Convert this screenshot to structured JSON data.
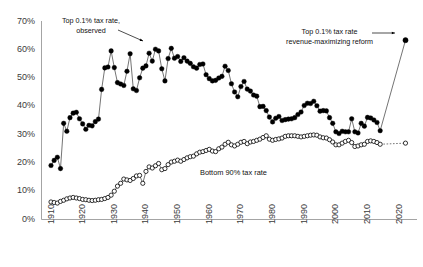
{
  "chart_data": {
    "type": "scatter",
    "title": "",
    "xlabel": "",
    "ylabel": "",
    "xlim": [
      1910,
      2026
    ],
    "ylim": [
      0,
      0.7
    ],
    "grid": false,
    "legend_position": "inline-annotations",
    "ytick_labels": [
      "0%",
      "10%",
      "20%",
      "30%",
      "40%",
      "50%",
      "60%",
      "70%"
    ],
    "ytick_values": [
      0,
      10,
      20,
      30,
      40,
      50,
      60,
      70
    ],
    "xtick_labels": [
      "1910",
      "1920",
      "1930",
      "1940",
      "1950",
      "1960",
      "1970",
      "1980",
      "1990",
      "2000",
      "2010",
      "2020"
    ],
    "xtick_values": [
      1910,
      1920,
      1930,
      1940,
      1950,
      1960,
      1970,
      1980,
      1990,
      2000,
      2010,
      2020
    ],
    "annotations": [
      {
        "name": "top-series-annotation",
        "text": "Top 0.1% tax rate,\nobserved",
        "x_px": 62,
        "y_px": 16,
        "arrow": "to-lower-right"
      },
      {
        "name": "reform-annotation",
        "text": "Top 0.1% tax rate\nrevenue-maximizing reform",
        "x_px": 286,
        "y_px": 27,
        "arrow": "to-right"
      },
      {
        "name": "bottom-series-annotation",
        "text": "Bottom 90% tax rate",
        "x_px": 200,
        "y_px": 168,
        "arrow": "none"
      }
    ],
    "series": [
      {
        "name": "Top 0.1% tax rate, observed",
        "marker": "filled-circle",
        "color": "#000000",
        "points": [
          [
            1913,
            19.1
          ],
          [
            1914,
            20.9
          ],
          [
            1915,
            22.0
          ],
          [
            1916,
            18.0
          ],
          [
            1917,
            34.0
          ],
          [
            1918,
            31.2
          ],
          [
            1919,
            36.0
          ],
          [
            1920,
            37.6
          ],
          [
            1921,
            37.9
          ],
          [
            1922,
            35.6
          ],
          [
            1923,
            33.8
          ],
          [
            1924,
            31.9
          ],
          [
            1925,
            33.3
          ],
          [
            1926,
            33.1
          ],
          [
            1927,
            34.6
          ],
          [
            1928,
            35.5
          ],
          [
            1929,
            46.0
          ],
          [
            1930,
            53.6
          ],
          [
            1931,
            53.9
          ],
          [
            1932,
            59.6
          ],
          [
            1933,
            53.7
          ],
          [
            1934,
            48.4
          ],
          [
            1935,
            47.9
          ],
          [
            1936,
            47.4
          ],
          [
            1937,
            52.4
          ],
          [
            1938,
            58.6
          ],
          [
            1939,
            46.2
          ],
          [
            1940,
            45.6
          ],
          [
            1941,
            50.1
          ],
          [
            1942,
            53.5
          ],
          [
            1943,
            54.3
          ],
          [
            1944,
            58.8
          ],
          [
            1945,
            56.0
          ],
          [
            1946,
            60.2
          ],
          [
            1947,
            59.6
          ],
          [
            1948,
            53.3
          ],
          [
            1949,
            49.0
          ],
          [
            1950,
            56.9
          ],
          [
            1951,
            60.5
          ],
          [
            1952,
            57.0
          ],
          [
            1953,
            57.6
          ],
          [
            1954,
            55.9
          ],
          [
            1955,
            57.2
          ],
          [
            1956,
            56.0
          ],
          [
            1957,
            55.2
          ],
          [
            1958,
            54.0
          ],
          [
            1959,
            53.5
          ],
          [
            1960,
            54.8
          ],
          [
            1961,
            55.0
          ],
          [
            1962,
            51.2
          ],
          [
            1963,
            49.8
          ],
          [
            1964,
            49.0
          ],
          [
            1965,
            49.2
          ],
          [
            1966,
            50.0
          ],
          [
            1967,
            50.6
          ],
          [
            1968,
            54.2
          ],
          [
            1969,
            52.7
          ],
          [
            1970,
            48.0
          ],
          [
            1971,
            45.1
          ],
          [
            1972,
            43.4
          ],
          [
            1973,
            47.0
          ],
          [
            1974,
            48.8
          ],
          [
            1975,
            46.1
          ],
          [
            1976,
            45.4
          ],
          [
            1977,
            44.0
          ],
          [
            1978,
            43.6
          ],
          [
            1979,
            39.9
          ],
          [
            1980,
            40.0
          ],
          [
            1981,
            38.5
          ],
          [
            1982,
            36.2
          ],
          [
            1983,
            34.5
          ],
          [
            1984,
            35.8
          ],
          [
            1985,
            36.4
          ],
          [
            1986,
            35.0
          ],
          [
            1987,
            35.3
          ],
          [
            1988,
            35.5
          ],
          [
            1989,
            35.6
          ],
          [
            1990,
            36.0
          ],
          [
            1991,
            37.1
          ],
          [
            1992,
            38.0
          ],
          [
            1993,
            40.3
          ],
          [
            1994,
            41.1
          ],
          [
            1995,
            41.0
          ],
          [
            1996,
            41.8
          ],
          [
            1997,
            40.2
          ],
          [
            1998,
            38.3
          ],
          [
            1999,
            38.5
          ],
          [
            2000,
            38.4
          ],
          [
            2001,
            36.0
          ],
          [
            2002,
            34.0
          ],
          [
            2003,
            31.0
          ],
          [
            2004,
            30.4
          ],
          [
            2005,
            31.2
          ],
          [
            2006,
            31.0
          ],
          [
            2007,
            31.0
          ],
          [
            2008,
            35.6
          ],
          [
            2009,
            31.0
          ],
          [
            2010,
            30.6
          ],
          [
            2011,
            34.0
          ],
          [
            2012,
            33.0
          ],
          [
            2013,
            36.1
          ],
          [
            2014,
            35.9
          ],
          [
            2015,
            35.2
          ],
          [
            2016,
            34.3
          ],
          [
            2017,
            31.4
          ]
        ]
      },
      {
        "name": "Top 0.1% tax rate, revenue-maximizing reform",
        "marker": "filled-circle",
        "color": "#000000",
        "line_style": "thin-connector",
        "points": [
          [
            2025,
            63.4
          ]
        ]
      },
      {
        "name": "Bottom 90% tax rate",
        "marker": "open-circle",
        "color": "#000000",
        "points": [
          [
            1913,
            6.2
          ],
          [
            1914,
            6.0
          ],
          [
            1915,
            5.8
          ],
          [
            1916,
            6.4
          ],
          [
            1917,
            6.8
          ],
          [
            1918,
            7.3
          ],
          [
            1919,
            7.6
          ],
          [
            1920,
            7.8
          ],
          [
            1921,
            7.6
          ],
          [
            1922,
            7.4
          ],
          [
            1923,
            7.1
          ],
          [
            1924,
            7.0
          ],
          [
            1925,
            6.8
          ],
          [
            1926,
            6.7
          ],
          [
            1927,
            6.8
          ],
          [
            1928,
            7.0
          ],
          [
            1929,
            7.1
          ],
          [
            1930,
            7.4
          ],
          [
            1931,
            7.8
          ],
          [
            1932,
            8.6
          ],
          [
            1933,
            10.0
          ],
          [
            1934,
            11.8
          ],
          [
            1935,
            12.8
          ],
          [
            1936,
            14.3
          ],
          [
            1937,
            14.0
          ],
          [
            1938,
            13.8
          ],
          [
            1939,
            14.5
          ],
          [
            1940,
            15.4
          ],
          [
            1941,
            15.6
          ],
          [
            1942,
            12.8
          ],
          [
            1943,
            17.0
          ],
          [
            1944,
            18.6
          ],
          [
            1945,
            18.2
          ],
          [
            1946,
            19.0
          ],
          [
            1947,
            19.8
          ],
          [
            1948,
            17.6
          ],
          [
            1949,
            18.0
          ],
          [
            1950,
            19.4
          ],
          [
            1951,
            20.3
          ],
          [
            1952,
            20.6
          ],
          [
            1953,
            21.0
          ],
          [
            1954,
            20.6
          ],
          [
            1955,
            21.2
          ],
          [
            1956,
            21.8
          ],
          [
            1957,
            22.2
          ],
          [
            1958,
            22.4
          ],
          [
            1959,
            23.2
          ],
          [
            1960,
            23.8
          ],
          [
            1961,
            24.0
          ],
          [
            1962,
            24.4
          ],
          [
            1963,
            24.8
          ],
          [
            1964,
            24.2
          ],
          [
            1965,
            24.0
          ],
          [
            1966,
            25.0
          ],
          [
            1967,
            25.6
          ],
          [
            1968,
            26.6
          ],
          [
            1969,
            27.3
          ],
          [
            1970,
            26.4
          ],
          [
            1971,
            26.0
          ],
          [
            1972,
            26.6
          ],
          [
            1973,
            27.3
          ],
          [
            1974,
            27.6
          ],
          [
            1975,
            26.8
          ],
          [
            1976,
            27.4
          ],
          [
            1977,
            27.6
          ],
          [
            1978,
            28.0
          ],
          [
            1979,
            28.4
          ],
          [
            1980,
            29.0
          ],
          [
            1981,
            29.6
          ],
          [
            1982,
            28.4
          ],
          [
            1983,
            28.0
          ],
          [
            1984,
            28.3
          ],
          [
            1985,
            28.5
          ],
          [
            1986,
            28.8
          ],
          [
            1987,
            29.4
          ],
          [
            1988,
            29.6
          ],
          [
            1989,
            29.6
          ],
          [
            1990,
            29.6
          ],
          [
            1991,
            29.4
          ],
          [
            1992,
            29.2
          ],
          [
            1993,
            29.4
          ],
          [
            1994,
            29.6
          ],
          [
            1995,
            29.8
          ],
          [
            1996,
            29.9
          ],
          [
            1997,
            29.8
          ],
          [
            1998,
            29.2
          ],
          [
            1999,
            28.9
          ],
          [
            2000,
            28.8
          ],
          [
            2001,
            28.2
          ],
          [
            2002,
            27.4
          ],
          [
            2003,
            26.4
          ],
          [
            2004,
            26.4
          ],
          [
            2005,
            27.0
          ],
          [
            2006,
            27.6
          ],
          [
            2007,
            28.0
          ],
          [
            2008,
            27.2
          ],
          [
            2009,
            25.8
          ],
          [
            2010,
            26.0
          ],
          [
            2011,
            26.4
          ],
          [
            2012,
            26.6
          ],
          [
            2013,
            27.6
          ],
          [
            2014,
            27.8
          ],
          [
            2015,
            27.6
          ],
          [
            2016,
            27.2
          ],
          [
            2017,
            26.6
          ],
          [
            2025,
            27.0
          ]
        ]
      }
    ]
  }
}
